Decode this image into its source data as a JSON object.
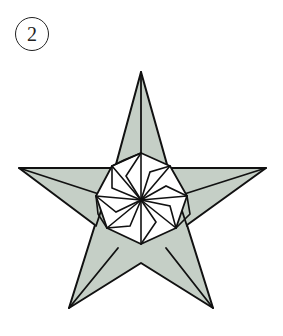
{
  "step": {
    "number": "2"
  },
  "diagram": {
    "fill_color": "#c5cfc6",
    "line_color": "#111111",
    "center_fill": "#ffffff"
  },
  "caption": {
    "text": ""
  }
}
